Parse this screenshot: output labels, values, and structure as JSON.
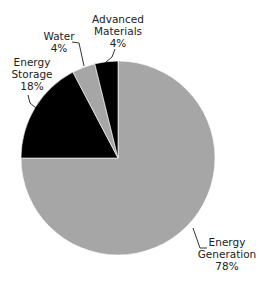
{
  "chart_data": {
    "type": "pie",
    "title": "",
    "categories": [
      "Energy Generation",
      "Energy Storage",
      "Water",
      "Advanced Materials"
    ],
    "values": [
      78,
      18,
      4,
      4
    ],
    "colors": [
      "#a6a6a6",
      "#000000",
      "#a6a6a6",
      "#000000"
    ],
    "labels": [
      {
        "name1": "Energy",
        "name2": "Generation",
        "pct": "78%"
      },
      {
        "name1": "Energy",
        "name2": "Storage",
        "pct": "18%"
      },
      {
        "name1": "Water",
        "name2": "",
        "pct": "4%"
      },
      {
        "name1": "Advanced",
        "name2": "Materials",
        "pct": "4%"
      }
    ],
    "legend": "none (callout labels with leader lines)"
  }
}
